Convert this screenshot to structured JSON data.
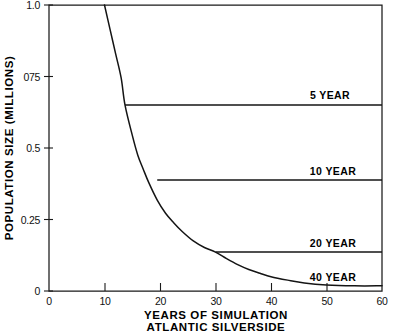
{
  "chart_data": {
    "type": "line",
    "title": "",
    "subtitle": "",
    "xlabel": "YEARS OF SIMULATION",
    "xlabel_line2": "ATLANTIC SILVERSIDE",
    "ylabel": "POPULATION SIZE (MILLIONS)",
    "xlim": [
      0,
      60
    ],
    "ylim": [
      0,
      1.0
    ],
    "xticks": [
      0,
      10,
      20,
      30,
      40,
      50,
      60
    ],
    "xtick_labels": [
      "0",
      "10",
      "20",
      "30",
      "40",
      "50",
      "60"
    ],
    "yticks": [
      0,
      0.25,
      0.5,
      0.75,
      1.0
    ],
    "ytick_labels": [
      "0",
      "0.25",
      "0.5",
      "075",
      "1.0"
    ],
    "grid": false,
    "legend_position": "inline-right",
    "series": [
      {
        "name": "decline-curve",
        "label": "",
        "points": [
          [
            10.0,
            1.0
          ],
          [
            11.0,
            0.915
          ],
          [
            12.0,
            0.83
          ],
          [
            13.0,
            0.745
          ],
          [
            13.7,
            0.65
          ],
          [
            15.0,
            0.545
          ],
          [
            16.0,
            0.475
          ],
          [
            17.0,
            0.425
          ],
          [
            18.0,
            0.378
          ],
          [
            19.5,
            0.318
          ],
          [
            21.0,
            0.272
          ],
          [
            22.5,
            0.238
          ],
          [
            24.0,
            0.208
          ],
          [
            26.0,
            0.175
          ],
          [
            28.0,
            0.152
          ],
          [
            30.0,
            0.136
          ],
          [
            32.0,
            0.113
          ],
          [
            34.0,
            0.092
          ],
          [
            36.0,
            0.075
          ],
          [
            38.0,
            0.062
          ],
          [
            40.0,
            0.05
          ],
          [
            43.0,
            0.038
          ],
          [
            46.0,
            0.028
          ],
          [
            50.0,
            0.021
          ],
          [
            55.0,
            0.018
          ],
          [
            60.0,
            0.018
          ]
        ]
      },
      {
        "name": "plateau-5-year",
        "label": "5 YEAR",
        "value": 0.65,
        "x_start": 13.7,
        "x_end": 60
      },
      {
        "name": "plateau-10-year",
        "label": "10 YEAR",
        "value": 0.388,
        "x_start": 19.5,
        "x_end": 60
      },
      {
        "name": "plateau-20-year",
        "label": "20 YEAR",
        "value": 0.136,
        "x_start": 30.0,
        "x_end": 60
      },
      {
        "name": "plateau-40-year",
        "label": "40 YEAR",
        "value": 0.018,
        "x_start": 46.0,
        "x_end": 60
      }
    ],
    "annotations": [
      {
        "name": "label-5-year",
        "text": "5 YEAR",
        "x": 52.2,
        "y": 0.695
      },
      {
        "name": "label-10-year",
        "text": "10 YEAR",
        "x": 51.4,
        "y": 0.43
      },
      {
        "name": "label-20-year",
        "text": "20 YEAR",
        "x": 51.4,
        "y": 0.178
      },
      {
        "name": "label-40-year",
        "text": "40 YEAR",
        "x": 51.4,
        "y": 0.058
      }
    ],
    "colors": {
      "line": "#141414",
      "axis": "#1a1a1a",
      "background": "#ffffff",
      "text": "#000000"
    }
  }
}
